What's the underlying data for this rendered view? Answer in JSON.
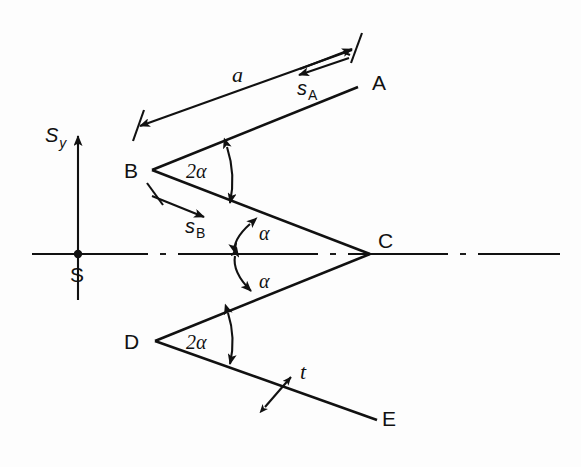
{
  "figure": {
    "type": "technical-line-diagram",
    "background_color": "#fdfdfd",
    "line_color": "#111111"
  },
  "axes": {
    "vertical_axis_label": "S",
    "vertical_axis_subscript": "y",
    "origin_label": "S",
    "origin_marker": "filled-dot",
    "horizontal_axis_style": "dash-dot centerline",
    "vertical_axis_style": "solid with up arrow"
  },
  "points": [
    {
      "id": "A",
      "label": "A"
    },
    {
      "id": "B",
      "label": "B"
    },
    {
      "id": "C",
      "label": "C"
    },
    {
      "id": "D",
      "label": "D"
    },
    {
      "id": "E",
      "label": "E"
    },
    {
      "id": "S",
      "label": "S"
    }
  ],
  "dimensions": [
    {
      "id": "a",
      "label": "a",
      "subscript": "",
      "kind": "length",
      "style": "double-ended dimension line with ticks"
    },
    {
      "id": "sA",
      "label": "s",
      "subscript": "A",
      "kind": "slip",
      "style": "single arrow pointing back toward B"
    },
    {
      "id": "sB",
      "label": "s",
      "subscript": "B",
      "kind": "slip",
      "style": "single arrow pointing toward C"
    },
    {
      "id": "t",
      "label": "t",
      "subscript": "",
      "kind": "thickness",
      "style": "small double-headed arrow across band"
    }
  ],
  "angles": [
    {
      "id": "angle-b",
      "label": "2α",
      "at": "B",
      "style": "double-headed arc"
    },
    {
      "id": "angle-c-upper",
      "label": "α",
      "at": "C",
      "style": "double-headed arc above centerline"
    },
    {
      "id": "angle-c-lower",
      "label": "α",
      "at": "C",
      "style": "double-headed arc below centerline"
    },
    {
      "id": "angle-d",
      "label": "2α",
      "at": "D",
      "style": "double-headed arc"
    }
  ],
  "greek": {
    "alpha": "α",
    "two_alpha": "2α"
  }
}
